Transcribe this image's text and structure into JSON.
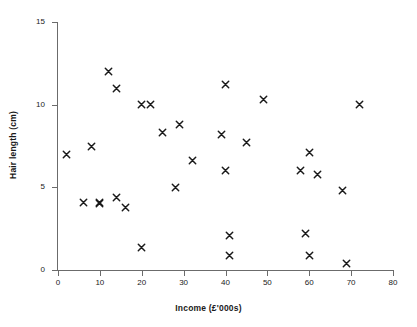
{
  "chart_data": {
    "type": "scatter",
    "title": "",
    "xlabel": "Income (£'000s)",
    "ylabel": "Hair length (cm)",
    "xlim": [
      0,
      80
    ],
    "ylim": [
      0,
      15
    ],
    "xticks": [
      0,
      10,
      20,
      30,
      40,
      50,
      60,
      70,
      80
    ],
    "yticks": [
      0,
      5,
      10,
      15
    ],
    "xtick_labels": [
      "0",
      "10",
      "20",
      "30",
      "40",
      "50",
      "60",
      "70",
      "80"
    ],
    "ytick_labels": [
      "0",
      "5",
      "10",
      "15"
    ],
    "grid": false,
    "legend": false,
    "marker": "x",
    "marker_color": "#1a1a1a",
    "series": [
      {
        "name": "Respondents",
        "points": [
          {
            "x": 2,
            "y": 7.0
          },
          {
            "x": 6,
            "y": 4.1
          },
          {
            "x": 8,
            "y": 7.5
          },
          {
            "x": 10,
            "y": 4.1
          },
          {
            "x": 10,
            "y": 4.0
          },
          {
            "x": 12,
            "y": 12.0
          },
          {
            "x": 14,
            "y": 11.0
          },
          {
            "x": 14,
            "y": 4.4
          },
          {
            "x": 16,
            "y": 3.8
          },
          {
            "x": 20,
            "y": 10.0
          },
          {
            "x": 20,
            "y": 1.35
          },
          {
            "x": 22,
            "y": 10.0
          },
          {
            "x": 25,
            "y": 8.3
          },
          {
            "x": 28,
            "y": 5.0
          },
          {
            "x": 29,
            "y": 8.8
          },
          {
            "x": 32,
            "y": 6.6
          },
          {
            "x": 39,
            "y": 8.2
          },
          {
            "x": 40,
            "y": 11.2
          },
          {
            "x": 40,
            "y": 6.0
          },
          {
            "x": 41,
            "y": 2.1
          },
          {
            "x": 41,
            "y": 0.9
          },
          {
            "x": 45,
            "y": 7.7
          },
          {
            "x": 49,
            "y": 10.3
          },
          {
            "x": 58,
            "y": 6.0
          },
          {
            "x": 59,
            "y": 2.2
          },
          {
            "x": 60,
            "y": 7.1
          },
          {
            "x": 60,
            "y": 0.9
          },
          {
            "x": 62,
            "y": 5.8
          },
          {
            "x": 68,
            "y": 4.8
          },
          {
            "x": 69,
            "y": 0.4
          },
          {
            "x": 72,
            "y": 10.0
          }
        ]
      }
    ]
  }
}
